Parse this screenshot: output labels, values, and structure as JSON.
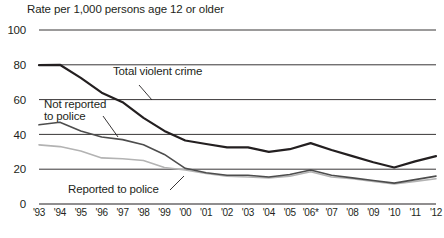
{
  "chart_data": {
    "type": "line",
    "title": "Rate per 1,000 persons age 12 or older",
    "xlabel": "",
    "ylabel": "",
    "ylim": [
      0,
      100
    ],
    "yticks": [
      "0",
      "20",
      "40",
      "60",
      "80",
      "100"
    ],
    "ytick_values": [
      0,
      20,
      40,
      60,
      80,
      100
    ],
    "grid": "horizontal",
    "legend": "inline-annotations",
    "categories": [
      "'93",
      "'94",
      "'95",
      "'96",
      "'97",
      "'98",
      "'99",
      "'00",
      "'01",
      "'02",
      "'03",
      "'04",
      "'05",
      "'06*",
      "'07",
      "'08",
      "'09",
      "'10",
      "'11",
      "'12"
    ],
    "x_values": [
      1993,
      1994,
      1995,
      1996,
      1997,
      1998,
      1999,
      2000,
      2001,
      2002,
      2003,
      2004,
      2005,
      2006,
      2007,
      2008,
      2009,
      2010,
      2011,
      2012
    ],
    "footnote_marker": "*",
    "series": [
      {
        "name": "Total violent crime",
        "color": "#231f20",
        "width": 2.2,
        "values": [
          79.8,
          80.0,
          72.5,
          64.0,
          58.5,
          49.5,
          42.0,
          36.5,
          34.5,
          32.5,
          32.5,
          30.0,
          31.5,
          35.0,
          31.0,
          27.5,
          24.0,
          21.0,
          24.5,
          27.5
        ]
      },
      {
        "name": "Not reported to police",
        "color": "#4d4d4d",
        "width": 1.6,
        "values": [
          45.5,
          47.0,
          42.0,
          38.5,
          37.0,
          34.0,
          28.5,
          20.5,
          18.0,
          16.5,
          16.5,
          15.5,
          17.0,
          19.5,
          16.5,
          15.0,
          13.5,
          12.0,
          14.0,
          16.0
        ]
      },
      {
        "name": "Reported to police",
        "color": "#b3b3b3",
        "width": 1.6,
        "values": [
          34.0,
          33.0,
          30.5,
          26.5,
          26.0,
          25.0,
          21.0,
          19.5,
          17.5,
          16.0,
          15.5,
          15.0,
          16.0,
          18.5,
          15.5,
          14.5,
          13.0,
          11.5,
          13.0,
          14.5
        ]
      }
    ],
    "annotations": [
      {
        "id": "total-violent-crime",
        "text": "Total violent crime",
        "x": 113,
        "y": 72
      },
      {
        "id": "not-reported-to-police",
        "line1": "Not reported",
        "line2": "to police",
        "x": 44,
        "y": 100
      },
      {
        "id": "reported-to-police",
        "text": "Reported to police",
        "x": 68,
        "y": 186
      }
    ]
  }
}
